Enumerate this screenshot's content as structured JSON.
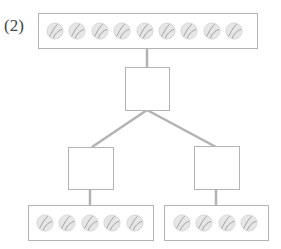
{
  "problem_label": "(2)",
  "colors": {
    "line": "#b3b3b3",
    "box_border": "#b3b3b3",
    "ball_fill": "#e6e6e6",
    "ball_stitch": "#9a9a9a"
  },
  "tree": {
    "root": {
      "ball_count": 9,
      "icon": "baseball-icon"
    },
    "middle_box": {
      "value": ""
    },
    "left_box": {
      "value": ""
    },
    "right_box": {
      "value": ""
    },
    "leaves": [
      {
        "ball_count": 5,
        "icon": "baseball-icon"
      },
      {
        "ball_count": 4,
        "icon": "baseball-icon"
      }
    ]
  }
}
